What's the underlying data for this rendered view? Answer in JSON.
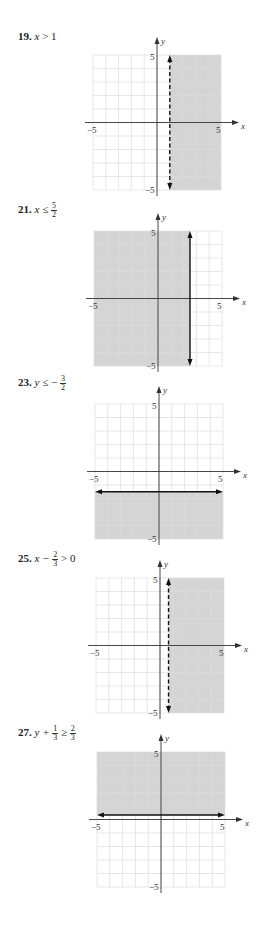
{
  "problems": [
    {
      "number": "19.",
      "var": "x",
      "op": ">",
      "rhs": "1",
      "label_text": "x > 1"
    },
    {
      "number": "21.",
      "var": "x",
      "op": "≤",
      "rhs_num": "5",
      "rhs_den": "2",
      "label_text": "x ≤ 5/2"
    },
    {
      "number": "23.",
      "var": "y",
      "op": "≤ −",
      "rhs_num": "3",
      "rhs_den": "2",
      "label_text": "y ≤ −3/2"
    },
    {
      "number": "25.",
      "pre": "x −",
      "frac_num": "2",
      "frac_den": "3",
      "post": "> 0",
      "label_text": "x − 2/3 > 0"
    },
    {
      "number": "27.",
      "pre": "y +",
      "frac_num": "1",
      "frac_den": "3",
      "op": "≥",
      "rhs_num": "2",
      "rhs_den": "3",
      "label_text": "y + 1/3 ≥ 2/3"
    }
  ],
  "axes": {
    "x_label": "x",
    "y_label": "y",
    "tick_pos": "5",
    "tick_neg": "−5"
  },
  "colors": {
    "shade": "#d4d4d4",
    "grid": "#dcdcdc",
    "axis": "#333333",
    "boundary": "#111111"
  },
  "chart_data": [
    {
      "type": "inequality_region",
      "title": "19. x > 1",
      "xlim": [
        -5,
        5
      ],
      "ylim": [
        -5,
        5
      ],
      "grid": true,
      "boundary": {
        "orientation": "vertical",
        "value": 1,
        "style": "dashed"
      },
      "shaded": "right",
      "tick_labels": [
        "-5",
        "5",
        "5",
        "-5"
      ],
      "xlabel": "x",
      "ylabel": "y"
    },
    {
      "type": "inequality_region",
      "title": "21. x ≤ 5/2",
      "xlim": [
        -5,
        5
      ],
      "ylim": [
        -5,
        5
      ],
      "grid": true,
      "boundary": {
        "orientation": "vertical",
        "value": 2.5,
        "style": "solid"
      },
      "shaded": "left",
      "tick_labels": [
        "-5",
        "5",
        "5",
        "-5"
      ],
      "xlabel": "x",
      "ylabel": "y"
    },
    {
      "type": "inequality_region",
      "title": "23. y ≤ -3/2",
      "xlim": [
        -5,
        5
      ],
      "ylim": [
        -5,
        5
      ],
      "grid": true,
      "boundary": {
        "orientation": "horizontal",
        "value": -1.5,
        "style": "solid"
      },
      "shaded": "below",
      "tick_labels": [
        "-5",
        "5",
        "5",
        "-5"
      ],
      "xlabel": "x",
      "ylabel": "y"
    },
    {
      "type": "inequality_region",
      "title": "25. x - 2/3 > 0",
      "xlim": [
        -5,
        5
      ],
      "ylim": [
        -5,
        5
      ],
      "grid": true,
      "boundary": {
        "orientation": "vertical",
        "value": 0.6667,
        "style": "dashed"
      },
      "shaded": "right",
      "tick_labels": [
        "-5",
        "5",
        "5",
        "-5"
      ],
      "xlabel": "x",
      "ylabel": "y"
    },
    {
      "type": "inequality_region",
      "title": "27. y + 1/3 ≥ 2/3",
      "xlim": [
        -5,
        5
      ],
      "ylim": [
        -5,
        5
      ],
      "grid": true,
      "boundary": {
        "orientation": "horizontal",
        "value": 0.3333,
        "style": "solid"
      },
      "shaded": "above",
      "tick_labels": [
        "-5",
        "5",
        "5",
        "-5"
      ],
      "xlabel": "x",
      "ylabel": "y"
    }
  ]
}
